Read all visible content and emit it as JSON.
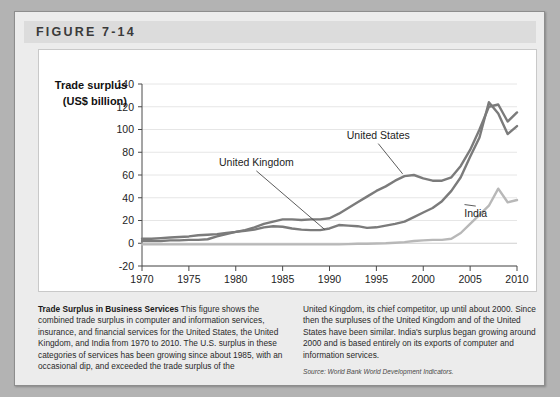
{
  "figure": {
    "label": "FIGURE 7-14"
  },
  "chart_data": {
    "type": "line",
    "title": "",
    "ylabel_line1": "Trade surplus",
    "ylabel_line2": "(US$ billion)",
    "xlabel": "",
    "xlim": [
      1970,
      2010
    ],
    "ylim": [
      -20,
      140
    ],
    "xticks": [
      "1970",
      "1975",
      "1980",
      "1985",
      "1990",
      "1995",
      "2000",
      "2005",
      "2010"
    ],
    "xtick_values": [
      1970,
      1975,
      1980,
      1985,
      1990,
      1995,
      2000,
      2005,
      2010
    ],
    "yticks": [
      "-20",
      "0",
      "20",
      "40",
      "60",
      "80",
      "100",
      "120",
      "140"
    ],
    "ytick_values": [
      -20,
      0,
      20,
      40,
      60,
      80,
      100,
      120,
      140
    ],
    "grid": true,
    "legend_position": "inline-annotations",
    "x": [
      1970,
      1971,
      1972,
      1973,
      1974,
      1975,
      1976,
      1977,
      1978,
      1979,
      1980,
      1981,
      1982,
      1983,
      1984,
      1985,
      1986,
      1987,
      1988,
      1989,
      1990,
      1991,
      1992,
      1993,
      1994,
      1995,
      1996,
      1997,
      1998,
      1999,
      2000,
      2001,
      2002,
      2003,
      2004,
      2005,
      2006,
      2007,
      2008,
      2009,
      2010
    ],
    "series": [
      {
        "name": "United States",
        "color": "#7b7b7b",
        "label_x": 1995.2,
        "label_y": 92,
        "leader_to_x": 1997.8,
        "leader_to_y": 61,
        "values": [
          4,
          4,
          4.5,
          5,
          5.5,
          6,
          7,
          7.5,
          8,
          9,
          10,
          11.5,
          14,
          17,
          19,
          21,
          21,
          20.5,
          21,
          21,
          22,
          26,
          31,
          36,
          41,
          46,
          50,
          55,
          59,
          60,
          57,
          55,
          55,
          58,
          68,
          82,
          100,
          120,
          122,
          107,
          115
        ]
      },
      {
        "name": "United Kingdom",
        "color": "#7b7b7b",
        "label_x": 1982.2,
        "label_y": 68,
        "leader_to_x": 1989.5,
        "leader_to_y": 12,
        "values": [
          2,
          2,
          2,
          2.5,
          2.5,
          3,
          3,
          3.5,
          6,
          8,
          10,
          11,
          12,
          14,
          15,
          14.5,
          13,
          12,
          11.5,
          11.5,
          13,
          16,
          15.5,
          15,
          13.5,
          14,
          15.5,
          17,
          19,
          23,
          27,
          31,
          37,
          46,
          58,
          76,
          93,
          124,
          114,
          96,
          103
        ]
      },
      {
        "name": "India",
        "color": "#b8b8b8",
        "label_x": 2005.6,
        "label_y": 23,
        "leader_to_x": 2004.4,
        "leader_to_y": 34,
        "values": [
          -1,
          -1,
          -1,
          -1,
          -1,
          -1,
          -1,
          -1,
          -1,
          -1,
          -1,
          -1,
          -1,
          -1,
          -1,
          -1,
          -1,
          -1,
          -1,
          -1,
          -1,
          -1,
          -0.8,
          -0.5,
          -0.5,
          -0.2,
          0,
          0.5,
          1,
          2,
          2.5,
          3,
          3,
          4,
          9,
          17,
          25,
          33,
          48,
          36,
          38
        ]
      }
    ]
  },
  "caption": {
    "title": "Trade Surplus in Business Services",
    "left_text": " This figure shows the combined trade surplus in computer and information services, insurance, and financial services for the United States, the United Kingdom, and India from 1970 to 2010. The U.S. surplus in these categories of services has been growing since about 1985, with an occasional dip, and exceeded the trade surplus of the",
    "right_text": "United Kingdom, its chief competitor, up until about 2000. Since then the surpluses of the United Kingdom and of the United States have been similar. India's surplus began growing around 2000 and is based entirely on its exports of computer and information services.",
    "source": "Source: World Bank World Development Indicators."
  }
}
